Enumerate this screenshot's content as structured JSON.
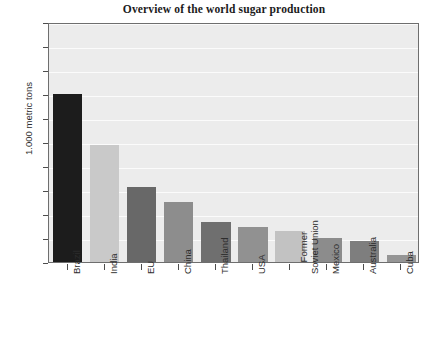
{
  "chart_data": {
    "type": "bar",
    "title": "Overview of the world sugar production",
    "xlabel": "",
    "ylabel": "1.000 metric tons",
    "ylim": [
      0,
      50
    ],
    "yticks": [
      0,
      5,
      10,
      15,
      20,
      25,
      30,
      35,
      40,
      45,
      50
    ],
    "grid": "horizontal",
    "legend": "none",
    "categories": [
      "Brazil",
      "India",
      "EU",
      "China",
      "Thailand",
      "USA",
      "Former\nSoviet Union",
      "Mexico",
      "Australia",
      "Cuba"
    ],
    "values": [
      35.0,
      24.3,
      15.7,
      12.6,
      8.4,
      7.3,
      6.4,
      5.1,
      4.3,
      1.5
    ],
    "bar_colors": [
      "#1c1c1c",
      "#c9c9c9",
      "#686868",
      "#8d8d8d",
      "#6f6f6f",
      "#919191",
      "#c2c2c2",
      "#8c8c8c",
      "#7e7e7e",
      "#959595"
    ],
    "plot_background": "#ececec",
    "grid_color": "#fbfbfb",
    "axis_color": "#6e6e6e",
    "text_color": "#2d2d2d"
  },
  "axis": {
    "y_label": "1.000 metric tons",
    "tick_labels": [
      "50",
      "45",
      "40",
      "35",
      "30",
      "25",
      "20",
      "15",
      "10",
      "5",
      "0"
    ]
  },
  "categories_display": [
    {
      "line1": "Brazil",
      "line2": ""
    },
    {
      "line1": "India",
      "line2": ""
    },
    {
      "line1": "EU",
      "line2": ""
    },
    {
      "line1": "China",
      "line2": ""
    },
    {
      "line1": "Thailand",
      "line2": ""
    },
    {
      "line1": "USA",
      "line2": ""
    },
    {
      "line1": "Former",
      "line2": "Soviet Union"
    },
    {
      "line1": "Mexico",
      "line2": ""
    },
    {
      "line1": "Australia",
      "line2": ""
    },
    {
      "line1": "Cuba",
      "line2": ""
    }
  ]
}
